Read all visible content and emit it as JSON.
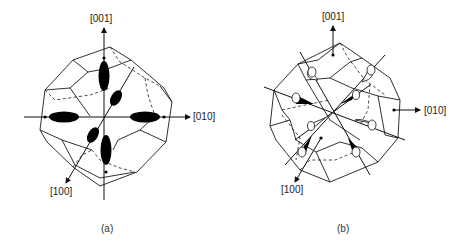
{
  "figure": {
    "panels": [
      {
        "id": "a",
        "caption": "(a)",
        "labels": {
          "z": "[001]",
          "y": "[010]",
          "x": "[100]"
        },
        "description": "Truncated octahedron (Brillouin zone) with six filled ellipsoidal valleys along the <100> axes"
      },
      {
        "id": "b",
        "caption": "(b)",
        "labels": {
          "z": "[001]",
          "y": "[010]",
          "x": "[100]"
        },
        "description": "Truncated octahedron with eight half-ellipsoid (cone) valleys along the <111> directions"
      }
    ]
  }
}
